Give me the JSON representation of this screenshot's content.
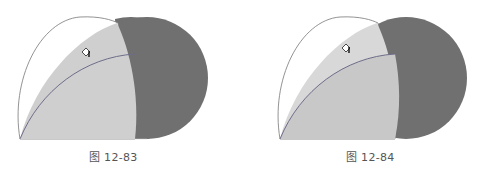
{
  "figures": [
    {
      "caption": "图 12-83",
      "cursor_icon": "paint-bucket-cursor"
    },
    {
      "caption": "图 12-84",
      "cursor_icon": "paint-bucket-cursor"
    }
  ],
  "colors": {
    "dark_circle": "#707070",
    "light_fill": "#cfcfcf",
    "outline": "#6b6b6b",
    "inner_curve": "#6d6d8a",
    "background": "#ffffff"
  }
}
